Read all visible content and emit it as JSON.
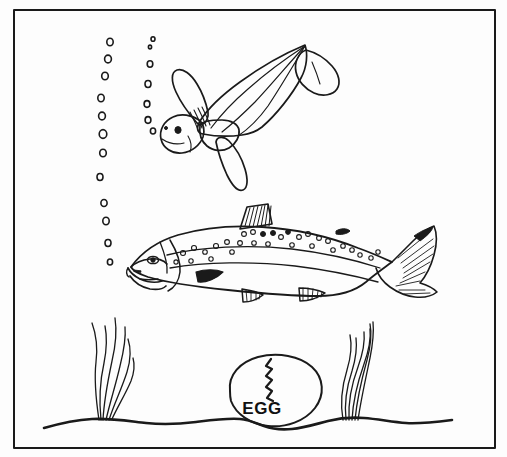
{
  "illustration": {
    "title": "Underwater scene: sea turtle, salmon, and cracked egg",
    "style": "black-and-white line drawing / coloring page",
    "background_color": "#fdfdfd",
    "ink_color": "#1a1a1a",
    "frame": {
      "name": "picture-frame",
      "x": 14,
      "y": 10,
      "width": 481,
      "height": 438,
      "stroke_width": 2
    },
    "labels": [
      {
        "name": "egg-label",
        "text": "EGG",
        "x": 262,
        "y": 414,
        "font_size": 17,
        "bold": true,
        "color": "#111111"
      }
    ],
    "subjects": [
      {
        "name": "sea-turtle",
        "kind": "leatherback-sea-turtle",
        "position": "upper-center",
        "description": "swimming downward-left, ridged carapace, front and rear flippers, eye and mouth visible"
      },
      {
        "name": "salmon-fish",
        "kind": "salmon",
        "position": "middle",
        "description": "spotted body, hatched dorsal fin, forked tail, open hooked jaw, facing left"
      },
      {
        "name": "fish-egg",
        "kind": "egg",
        "position": "bottom-center",
        "description": "oval egg resting on seafloor with zigzag crack and EGG text"
      },
      {
        "name": "seaweed-left",
        "kind": "seaweed",
        "position": "bottom-left",
        "strand_count": 5
      },
      {
        "name": "seaweed-right",
        "kind": "seaweed",
        "position": "bottom-right",
        "strand_count": 5
      },
      {
        "name": "seafloor",
        "kind": "ground-line",
        "position": "bottom",
        "description": "wavy horizontal seabed line"
      }
    ],
    "bubbles": {
      "name": "bubble-trails",
      "trail_left": {
        "name": "bubble-trail-left",
        "count": 12,
        "points": [
          {
            "x": 110,
            "y": 42,
            "r": 3.2
          },
          {
            "x": 108,
            "y": 59,
            "r": 3.4
          },
          {
            "x": 105,
            "y": 76,
            "r": 3.3
          },
          {
            "x": 101,
            "y": 98,
            "r": 3.2
          },
          {
            "x": 102,
            "y": 116,
            "r": 3.4
          },
          {
            "x": 103,
            "y": 134,
            "r": 3.8
          },
          {
            "x": 103,
            "y": 153,
            "r": 3.3
          },
          {
            "x": 100,
            "y": 177,
            "r": 3.0
          },
          {
            "x": 104,
            "y": 203,
            "r": 3.1
          },
          {
            "x": 106,
            "y": 221,
            "r": 3.2
          },
          {
            "x": 108,
            "y": 243,
            "r": 3.0
          },
          {
            "x": 110,
            "y": 262,
            "r": 2.6
          }
        ]
      },
      "trail_right": {
        "name": "bubble-trail-right",
        "count": 7,
        "points": [
          {
            "x": 153,
            "y": 39,
            "r": 2.0
          },
          {
            "x": 150,
            "y": 47,
            "r": 1.6
          },
          {
            "x": 150,
            "y": 64,
            "r": 2.8
          },
          {
            "x": 148,
            "y": 84,
            "r": 3.0
          },
          {
            "x": 147,
            "y": 104,
            "r": 2.9
          },
          {
            "x": 148,
            "y": 120,
            "r": 2.9
          },
          {
            "x": 153,
            "y": 131,
            "r": 2.6
          }
        ]
      }
    }
  }
}
